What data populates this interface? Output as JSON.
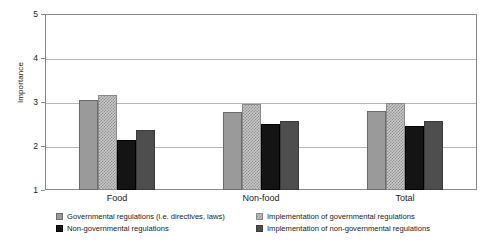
{
  "chart_data": {
    "type": "bar",
    "title": "",
    "subtitle": "",
    "xlabel": "",
    "ylabel": "Importance",
    "ylim": [
      1,
      5
    ],
    "yticks": [
      1,
      2,
      3,
      4,
      5
    ],
    "ytick_labels": [
      "1",
      "2",
      "3",
      "4",
      "5"
    ],
    "grid": true,
    "grid_axis": "y",
    "legend_position": "bottom",
    "legend_columns": 2,
    "categories": [
      "Food",
      "Non-food",
      "Total"
    ],
    "series": [
      {
        "name": "Governmental regulations (i.e. directives, laws)",
        "color": "#9a9a9a",
        "pattern": "solid",
        "values": [
          3.05,
          2.77,
          2.79
        ]
      },
      {
        "name": "Implementation of governmental regulations",
        "color": "#c9c9c9",
        "pattern": "checkered",
        "values": [
          3.16,
          2.95,
          2.98
        ]
      },
      {
        "name": "Non-governmental regulations",
        "color": "#141414",
        "pattern": "solid",
        "values": [
          2.13,
          2.5,
          2.45
        ]
      },
      {
        "name": "Implementation of non-governmental regulations",
        "color": "#4e4e4e",
        "pattern": "solid",
        "values": [
          2.37,
          2.57,
          2.56
        ]
      }
    ]
  }
}
